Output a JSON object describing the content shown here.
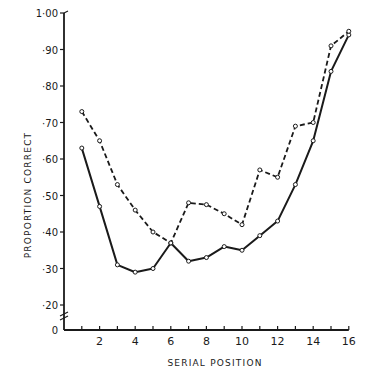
{
  "chart_data": {
    "type": "line",
    "title": "",
    "xlabel": "SERIAL POSITION",
    "ylabel": "PROPORTION CORRECT",
    "x": [
      1,
      2,
      3,
      4,
      5,
      6,
      7,
      8,
      9,
      10,
      11,
      12,
      13,
      14,
      15,
      16
    ],
    "x_tick_labels": [
      "2",
      "4",
      "6",
      "8",
      "10",
      "12",
      "14",
      "16"
    ],
    "x_tick_values": [
      2,
      4,
      6,
      8,
      10,
      12,
      14,
      16
    ],
    "y_tick_labels": [
      "0",
      "·20",
      "·30",
      "·40",
      "·50",
      "·60",
      "·70",
      "·80",
      "·90",
      "1·00"
    ],
    "y_tick_values": [
      0,
      0.2,
      0.3,
      0.4,
      0.5,
      0.6,
      0.7,
      0.8,
      0.9,
      1.0
    ],
    "xlim": [
      0,
      16
    ],
    "ylim": [
      0,
      1.0
    ],
    "y_axis_break": "between 0 and ·20",
    "grid": false,
    "legend": null,
    "series": [
      {
        "name": "solid line",
        "style": "solid",
        "marker": "open-circle",
        "values": [
          0.63,
          0.47,
          0.31,
          0.29,
          0.3,
          0.37,
          0.32,
          0.33,
          0.36,
          0.35,
          0.39,
          0.43,
          0.53,
          0.65,
          0.84,
          0.94
        ]
      },
      {
        "name": "dashed line",
        "style": "dashed",
        "marker": "open-circle",
        "values": [
          0.73,
          0.65,
          0.53,
          0.46,
          0.4,
          0.37,
          0.48,
          0.475,
          0.45,
          0.42,
          0.57,
          0.55,
          0.69,
          0.7,
          0.91,
          0.95
        ]
      }
    ]
  },
  "colors": {
    "ink": "#1a1a1a",
    "background": "#ffffff"
  }
}
